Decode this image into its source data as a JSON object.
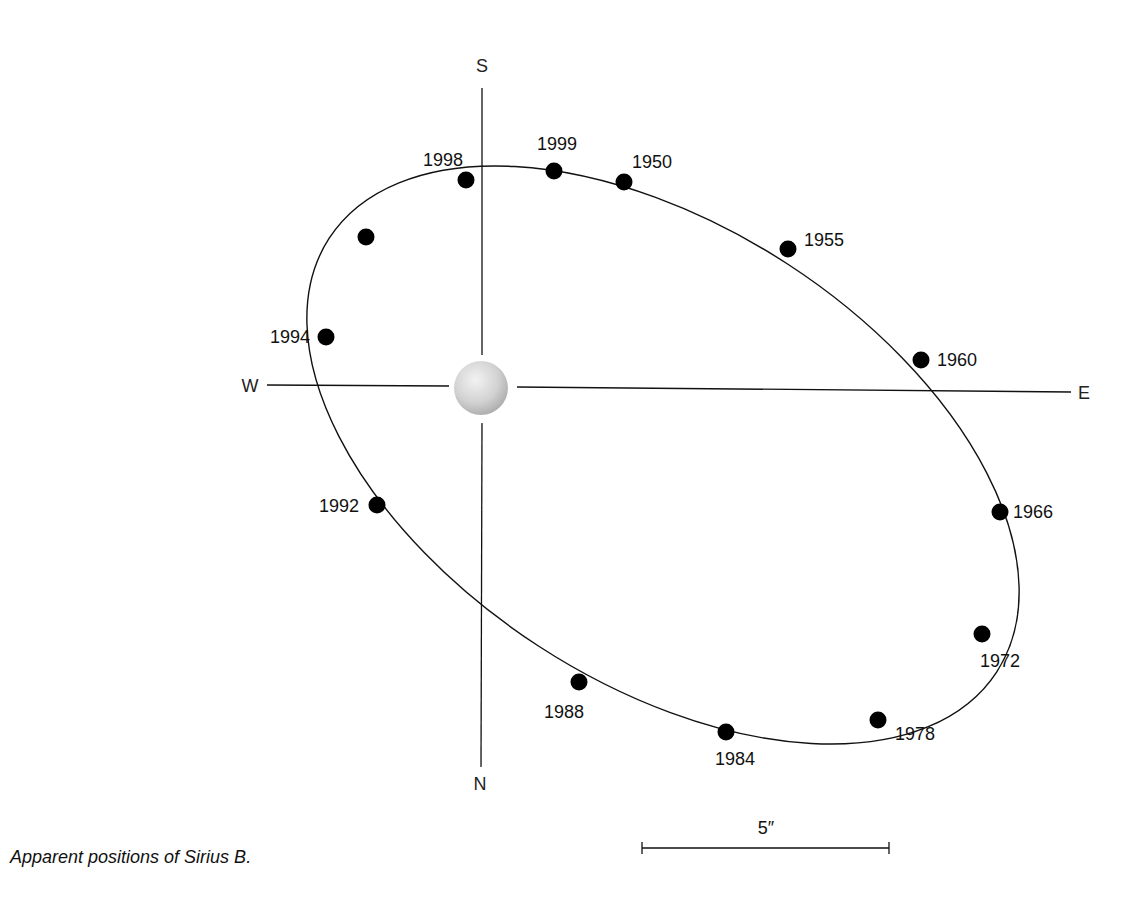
{
  "figure": {
    "caption": "Apparent positions of Sirius B.",
    "compass": {
      "north": "N",
      "south": "S",
      "east": "E",
      "west": "W"
    },
    "scale_bar": {
      "label": "5″",
      "x1": 642,
      "x2": 889,
      "y": 848
    },
    "central_star": {
      "name": "Sirius A",
      "cx": 481,
      "cy": 388,
      "r": 27,
      "color": "#d8d8d8"
    },
    "orbit": {
      "cx": 663,
      "cy": 455,
      "rx": 398,
      "ry": 228,
      "rotation_deg": 33,
      "stroke": "#111111"
    },
    "positions": [
      {
        "year": "1950",
        "x": 624,
        "y": 182,
        "label_x": 632,
        "label_y": 168,
        "anchor": "start"
      },
      {
        "year": "1955",
        "x": 788,
        "y": 249,
        "label_x": 804,
        "label_y": 246,
        "anchor": "start"
      },
      {
        "year": "1960",
        "x": 921,
        "y": 360,
        "label_x": 937,
        "label_y": 366,
        "anchor": "start"
      },
      {
        "year": "1966",
        "x": 1000,
        "y": 512,
        "label_x": 1013,
        "label_y": 518,
        "anchor": "start"
      },
      {
        "year": "1972",
        "x": 982,
        "y": 634,
        "label_x": 980,
        "label_y": 667,
        "anchor": "start"
      },
      {
        "year": "1978",
        "x": 878,
        "y": 720,
        "label_x": 895,
        "label_y": 740,
        "anchor": "start"
      },
      {
        "year": "1984",
        "x": 726,
        "y": 732,
        "label_x": 735,
        "label_y": 765,
        "anchor": "middle"
      },
      {
        "year": "1988",
        "x": 579,
        "y": 682,
        "label_x": 564,
        "label_y": 718,
        "anchor": "middle"
      },
      {
        "year": "1992",
        "x": 377,
        "y": 505,
        "label_x": 359,
        "label_y": 512,
        "anchor": "end"
      },
      {
        "year": "1994",
        "x": 326,
        "y": 337,
        "label_x": 310,
        "label_y": 343,
        "anchor": "end"
      },
      {
        "year": "",
        "x": 366,
        "y": 237,
        "label_x": 0,
        "label_y": 0,
        "anchor": "start"
      },
      {
        "year": "1998",
        "x": 466,
        "y": 180,
        "label_x": 443,
        "label_y": 166,
        "anchor": "middle"
      },
      {
        "year": "1999",
        "x": 554,
        "y": 171,
        "label_x": 557,
        "label_y": 150,
        "anchor": "middle"
      }
    ]
  },
  "chart_data": {
    "type": "scatter",
    "title": "Apparent positions of Sirius B.",
    "xlabel": "W – E",
    "ylabel": "S – N",
    "scale": "5 arcsec",
    "points": [
      {
        "label": "1950",
        "x": 624,
        "y": 182
      },
      {
        "label": "1955",
        "x": 788,
        "y": 249
      },
      {
        "label": "1960",
        "x": 921,
        "y": 360
      },
      {
        "label": "1966",
        "x": 1000,
        "y": 512
      },
      {
        "label": "1972",
        "x": 982,
        "y": 634
      },
      {
        "label": "1978",
        "x": 878,
        "y": 720
      },
      {
        "label": "1984",
        "x": 726,
        "y": 732
      },
      {
        "label": "1988",
        "x": 579,
        "y": 682
      },
      {
        "label": "1992",
        "x": 377,
        "y": 505
      },
      {
        "label": "1994",
        "x": 326,
        "y": 337
      },
      {
        "label": "(unlabeled)",
        "x": 366,
        "y": 237
      },
      {
        "label": "1998",
        "x": 466,
        "y": 180
      },
      {
        "label": "1999",
        "x": 554,
        "y": 171
      }
    ]
  }
}
